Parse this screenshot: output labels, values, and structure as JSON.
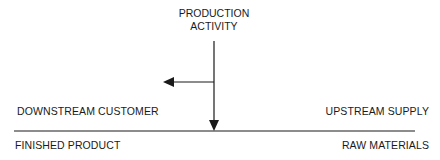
{
  "diagram": {
    "title_line1": "PRODUCTION",
    "title_line2": "ACTIVITY",
    "left_upper": "DOWNSTREAM CUSTOMER",
    "left_lower": "FINISHED PRODUCT",
    "right_upper": "UPSTREAM SUPPLY",
    "right_lower": "RAW MATERIALS",
    "line_color": "#1a1a1a"
  }
}
